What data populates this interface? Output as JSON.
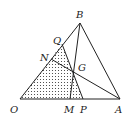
{
  "diagram": {
    "type": "geometry",
    "points": {
      "O": {
        "label": "O",
        "x": 20,
        "y": 99
      },
      "A": {
        "label": "A",
        "x": 120,
        "y": 99
      },
      "B": {
        "label": "B",
        "x": 80,
        "y": 23
      },
      "G": {
        "label": "G",
        "x": 73,
        "y": 71
      },
      "M": {
        "label": "M",
        "x": 70,
        "y": 99
      },
      "P": {
        "label": "P",
        "x": 83,
        "y": 99
      },
      "N": {
        "label": "N",
        "x": 51,
        "y": 59
      },
      "Q": {
        "label": "Q",
        "x": 62,
        "y": 44
      }
    },
    "segments": [
      [
        "O",
        "A"
      ],
      [
        "O",
        "B"
      ],
      [
        "B",
        "A"
      ],
      [
        "B",
        "M"
      ],
      [
        "N",
        "A"
      ],
      [
        "Q",
        "P"
      ]
    ],
    "shaded_region": [
      "O",
      "Q",
      "P"
    ],
    "shading": "dots"
  }
}
